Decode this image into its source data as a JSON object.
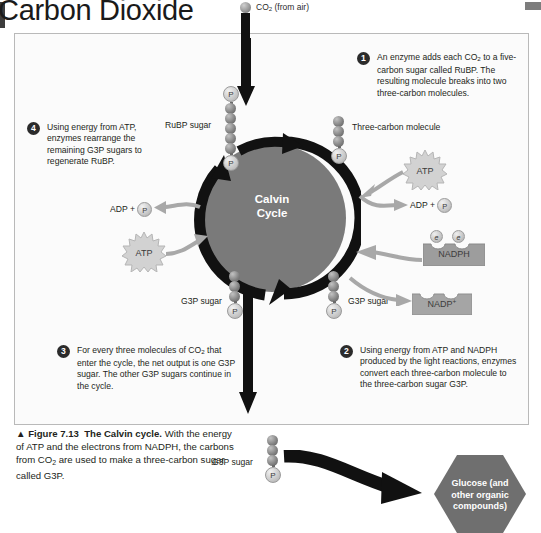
{
  "page": {
    "title": "Carbon Dioxide"
  },
  "inlet": {
    "co2_label_pre": "CO",
    "co2_label_sub": "2",
    "co2_label_post": " (from air)"
  },
  "cycle": {
    "center_line1": "Calvin",
    "center_line2": "Cycle",
    "disc_color": "#7a7a7a",
    "ring_color": "#111111"
  },
  "steps": [
    {
      "number": "1",
      "text": "An enzyme adds each CO2 to a five-carbon sugar called RuBP. The resulting molecule breaks into two three-carbon molecules.",
      "html": "An enzyme adds each CO<sub>2</sub> to a five-carbon sugar called RuBP. The resulting molecule breaks into two three-carbon molecules."
    },
    {
      "number": "2",
      "text": "Using energy from ATP and NADPH produced by the light reactions, enzymes convert each three-carbon molecule to the three-carbon sugar G3P.",
      "html": "Using energy from ATP and NADPH produced by the light reactions, enzymes convert each three-carbon molecule to the three-carbon sugar G3P."
    },
    {
      "number": "3",
      "text": "For every three molecules of CO2 that enter the cycle, the net output is one G3P sugar. The other G3P sugars continue in the cycle.",
      "html": "For every three molecules of CO<sub>2</sub> that enter the cycle, the net output is one G3P sugar. The other G3P sugars continue in the cycle."
    },
    {
      "number": "4",
      "text": "Using energy from ATP, enzymes rearrange the remaining G3P sugars to regenerate RuBP.",
      "html": "Using energy from ATP, enzymes rearrange the remaining G3P sugars to regenerate RuBP."
    }
  ],
  "molecules": {
    "rubp_label": "RuBP sugar",
    "three_carbon_label": "Three-carbon molecule",
    "g3p_left_label": "G3P sugar",
    "g3p_right_label": "G3P sugar",
    "g3p_output_label": "G3P sugar",
    "phosphate_symbol": "P",
    "rubp_carbons": 5,
    "three_carbon_carbons": 3,
    "g3p_carbons": 3
  },
  "energy": {
    "atp_left": "ATP",
    "atp_right": "ATP",
    "adp_left": "ADP + ",
    "adp_right": "ADP + ",
    "phosphate_symbol": "P",
    "nadph": "NADPH",
    "nadp_plus_base": "NADP",
    "nadp_plus_sup": "+",
    "electron_symbol": "e",
    "electron_count": 2
  },
  "output": {
    "glucose_line1": "Glucose (and",
    "glucose_line2": "other organic",
    "glucose_line3": "compounds)",
    "glucose_color": "#6f6f6f"
  },
  "caption": {
    "arrow": "▲",
    "figure_number": "Figure 7.13",
    "figure_title": "The Calvin cycle.",
    "body": "With the energy of ATP and the electrons from NADPH, the carbons from CO2 are used to make a three-carbon sugar called G3P.",
    "body_html": "With the energy of ATP and the electrons from NADPH, the carbons from CO<sub>2</sub> are used to make a three-carbon sugar called G3P."
  }
}
